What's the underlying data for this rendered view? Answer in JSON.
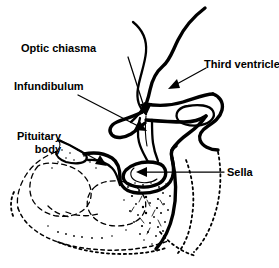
{
  "figure": {
    "name": "Sagittal section of the pituitary fossa and sella turcica",
    "type": "anatomical-line-diagram",
    "background_color": "#ffffff",
    "ink_color": "#000000",
    "width": 279,
    "height": 268
  },
  "labels": {
    "optic_chiasma": "Optic chiasma",
    "infundibulum": "Infundibulum",
    "pituitary_body_line1": "Pituitary",
    "pituitary_body_line2": "body",
    "third_ventricle": "Third ventricle",
    "sella": "Sella"
  },
  "annotations": [
    {
      "id": "optic-chiasma",
      "label": "Optic chiasma",
      "leader_from": [
        128,
        57
      ],
      "leader_to": [
        146,
        113
      ],
      "arrow": true
    },
    {
      "id": "infundibulum",
      "label": "Infundibulum",
      "leader_from": [
        78,
        95
      ],
      "leader_to": [
        146,
        131
      ],
      "arrow": true
    },
    {
      "id": "pituitary-body",
      "label": "Pituitary body",
      "leader_from": [
        58,
        140
      ],
      "leader_to": [
        106,
        166
      ],
      "arrow": true
    },
    {
      "id": "third-ventricle",
      "label": "Third ventricle",
      "leader_from": [
        206,
        68
      ],
      "leader_to": [
        170,
        88
      ],
      "arrow": true
    },
    {
      "id": "sella",
      "label": "Sella",
      "leader_from": [
        224,
        172
      ],
      "leader_to": [
        138,
        172
      ],
      "arrow": true
    }
  ],
  "structures": [
    "hypothalamic floor and third ventricle wall",
    "optic chiasma",
    "infundibulum (pituitary stalk)",
    "pituitary body in the hypophysial fossa",
    "dorsum sellae with posterior clinoid oval",
    "sphenoid bone with cancellous stippling",
    "sphenoid air sinus chambers (dashed outlines)",
    "clivus and basiocciput (dotted outlines)"
  ]
}
